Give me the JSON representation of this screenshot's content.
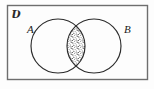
{
  "figure": {
    "kind": "venn-diagram",
    "width": 154,
    "height": 89
  },
  "labels": {
    "universe": "Ʋ",
    "universe_name": "universal-set-symbol",
    "set_a": "A",
    "set_b": "B"
  },
  "shapes": {
    "universe_rect": {
      "name": "universal-set-rectangle",
      "x": 7,
      "y": 5,
      "width": 141,
      "height": 75
    },
    "circle_a": {
      "name": "set-a-circle",
      "cx": 58,
      "cy": 46,
      "r": 27
    },
    "circle_b": {
      "name": "set-b-circle",
      "cx": 94,
      "cy": 46,
      "r": 27
    },
    "intersection": {
      "name": "intersection-region",
      "fill": "stipple",
      "top_crossing_y": 22,
      "bottom_crossing_y": 70,
      "center_x": 76
    }
  },
  "colors": {
    "stroke": "#2b2b2b",
    "rect_stroke": "#6e6e6e",
    "background": "#fdfdfd",
    "stipple": "#303030"
  }
}
